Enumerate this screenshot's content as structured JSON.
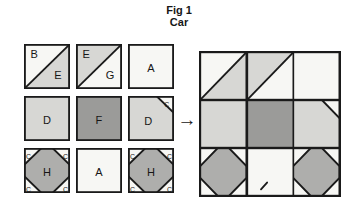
{
  "title": {
    "line1": "Fig 1",
    "line2": "Car"
  },
  "arrow": {
    "glyph": "→"
  },
  "palette": {
    "white": "#f7f7f4",
    "light": "#d7d7d4",
    "mid": "#aeaeac",
    "dark": "#9b9b99",
    "line": "#1a1a1a",
    "text": "#161616"
  },
  "left_grid": {
    "rows": [
      [
        {
          "type": "hst",
          "top_left": {
            "fill": "white",
            "label": "B"
          },
          "bottom_right": {
            "fill": "light",
            "label": "E"
          }
        },
        {
          "type": "hst",
          "top_left": {
            "fill": "light",
            "label": "E"
          },
          "bottom_right": {
            "fill": "white",
            "label": "G"
          }
        },
        {
          "type": "plain",
          "fill": "white",
          "label": "A"
        }
      ],
      [
        {
          "type": "plain",
          "fill": "light",
          "label": "D"
        },
        {
          "type": "plain",
          "fill": "dark",
          "label": "F"
        },
        {
          "type": "corner_tr",
          "fill": "light",
          "label": "D",
          "corner": {
            "fill": "white",
            "label": "C"
          }
        }
      ],
      [
        {
          "type": "diamond",
          "fill": "white",
          "diamond": {
            "fill": "mid",
            "label": "H"
          },
          "corner_label": "C"
        },
        {
          "type": "plain",
          "fill": "white",
          "label": "A"
        },
        {
          "type": "diamond",
          "fill": "white",
          "diamond": {
            "fill": "mid",
            "label": "H"
          },
          "corner_label": "C"
        }
      ]
    ]
  },
  "assembled_block": {
    "rows": [
      [
        {
          "type": "hst",
          "top_left": {
            "fill": "white"
          },
          "bottom_right": {
            "fill": "light"
          }
        },
        {
          "type": "hst",
          "top_left": {
            "fill": "light"
          },
          "bottom_right": {
            "fill": "white"
          }
        },
        {
          "type": "plain",
          "fill": "white"
        }
      ],
      [
        {
          "type": "plain",
          "fill": "light"
        },
        {
          "type": "plain",
          "fill": "dark"
        },
        {
          "type": "corner_tr",
          "fill": "light",
          "corner": {
            "fill": "white"
          }
        }
      ],
      [
        {
          "type": "diamond",
          "fill": "white",
          "diamond": {
            "fill": "mid"
          }
        },
        {
          "type": "plain",
          "fill": "white",
          "mark": true
        },
        {
          "type": "diamond",
          "fill": "white",
          "diamond": {
            "fill": "mid"
          }
        }
      ]
    ]
  }
}
